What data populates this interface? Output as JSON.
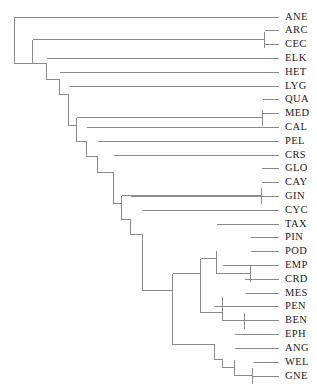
{
  "figure": {
    "type": "phylogenetic-tree",
    "title": "",
    "orientation": "left-to-right rectangular cladogram",
    "taxa_count": 24,
    "line_color": "#8a8a8a",
    "label_color": "#1b1b1b",
    "background_color": "#ffffff",
    "top_artifact_text": ""
  },
  "chart_data": {
    "type": "tree",
    "title": "",
    "xlabel": "",
    "ylabel": "",
    "grid": false,
    "legend": "none",
    "root_x": 14,
    "tip_x": 278,
    "label_x": 285,
    "first_tip_y": 16,
    "tip_spacing": 15.6,
    "tips": [
      {
        "id": "ANE",
        "label": "ANE",
        "index": 0,
        "y": 16,
        "node_x": 14
      },
      {
        "id": "ARC",
        "label": "ARC",
        "index": 1,
        "y": 31.6,
        "node_x": 264
      },
      {
        "id": "CEC",
        "label": "CEC",
        "index": 2,
        "y": 47.2,
        "node_x": 264
      },
      {
        "id": "ELK",
        "label": "ELK",
        "index": 3,
        "y": 62.8,
        "node_x": 46
      },
      {
        "id": "HET",
        "label": "HET",
        "index": 4,
        "y": 78.4,
        "node_x": 59
      },
      {
        "id": "LYG",
        "label": "LYG",
        "index": 5,
        "y": 94,
        "node_x": 68
      },
      {
        "id": "QUA",
        "label": "QUA",
        "index": 6,
        "y": 109.6,
        "node_x": 262
      },
      {
        "id": "MED",
        "label": "MED",
        "index": 7,
        "y": 125.2,
        "node_x": 262
      },
      {
        "id": "CAL",
        "label": "CAL",
        "index": 8,
        "y": 140.8,
        "node_x": 86
      },
      {
        "id": "PEL",
        "label": "PEL",
        "index": 9,
        "y": 156.4,
        "node_x": 97
      },
      {
        "id": "CRS",
        "label": "CRS",
        "index": 10,
        "y": 172,
        "node_x": 113
      },
      {
        "id": "GLO",
        "label": "GLO",
        "index": 11,
        "y": 187.6,
        "node_x": 261
      },
      {
        "id": "CAY",
        "label": "CAY",
        "index": 12,
        "y": 203.2,
        "node_x": 261
      },
      {
        "id": "GIN",
        "label": "GIN",
        "index": 13,
        "y": 218.8,
        "node_x": 130
      },
      {
        "id": "CYC",
        "label": "CYC",
        "index": 14,
        "y": 234.4,
        "node_x": 130
      },
      {
        "id": "TAX",
        "label": "TAX",
        "index": 15,
        "y": 250,
        "node_x": 233
      },
      {
        "id": "PIN",
        "label": "PIN",
        "index": 16,
        "y": 265.6,
        "node_x": 250
      },
      {
        "id": "POD",
        "label": "POD",
        "index": 17,
        "y": 281.2,
        "node_x": 250
      },
      {
        "id": "EMP",
        "label": "EMP",
        "index": 18,
        "y": 296.8,
        "node_x": 243
      },
      {
        "id": "CRD",
        "label": "CRD",
        "index": 19,
        "y": 312.4,
        "node_x": 253
      },
      {
        "id": "MES",
        "label": "MES",
        "index": 20,
        "y": 328,
        "node_x": 253
      },
      {
        "id": "PEN",
        "label": "PEN",
        "index": 21,
        "y": 343.6,
        "node_x": 214
      },
      {
        "id": "BEN",
        "label": "BEN",
        "index": 22,
        "y": 359.2,
        "node_x": 222
      },
      {
        "id": "EPH",
        "label": "EPH",
        "index": 23,
        "y": 374.8,
        "node_x": 233
      }
    ],
    "tip_labels_ordered": [
      "ANE",
      "ARC",
      "CEC",
      "ELK",
      "HET",
      "LYG",
      "QUA",
      "MED",
      "CAL",
      "PEL",
      "CRS",
      "GLO",
      "CAY",
      "GIN",
      "CYC",
      "TAX",
      "PIN",
      "POD",
      "EMP",
      "CRD",
      "MES",
      "PEN",
      "BEN",
      "EPH",
      "ANG",
      "WEL",
      "GNE"
    ],
    "newick": "(ANE,((ARC,CEC),(ELK,(HET,(LYG,((QUA,MED),(CAL,(PEL,(CRS,((GLO,CAY),(GIN,(CYC,(((TAX,(PIN,POD)),(EMP,(CRD,MES))),(PEN,(BEN,(EPH,(ANG,(WEL,GNE))))))))))))))));"
  },
  "labels": {
    "l0": "ANE",
    "l1": "ARC",
    "l2": "CEC",
    "l3": "ELK",
    "l4": "HET",
    "l5": "LYG",
    "l6": "QUA",
    "l7": "MED",
    "l8": "CAL",
    "l9": "PEL",
    "l10": "CRS",
    "l11": "GLO",
    "l12": "CAY",
    "l13": "GIN",
    "l14": "CYC",
    "l15": "TAX",
    "l16": "PIN",
    "l17": "POD",
    "l18": "EMP",
    "l19": "CRD",
    "l20": "MES",
    "l21": "PEN",
    "l22": "BEN",
    "l23": "EPH",
    "l24": "ANG",
    "l25": "WEL",
    "l26": "GNE"
  }
}
